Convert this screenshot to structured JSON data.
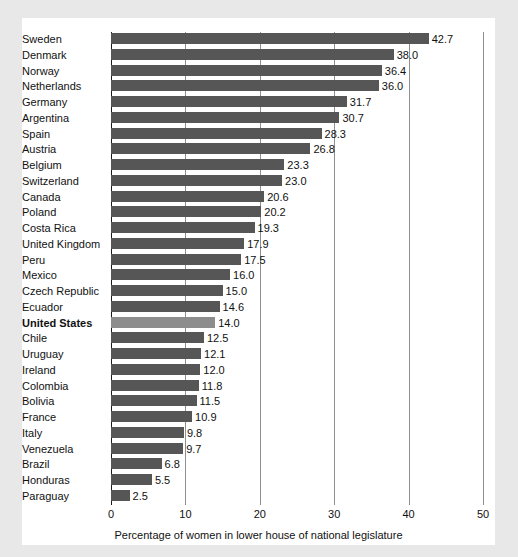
{
  "chart_data": {
    "type": "bar",
    "orientation": "horizontal",
    "title": "",
    "xlabel": "Percentage of women in lower house of national legislature",
    "ylabel": "",
    "xlim": [
      0,
      50
    ],
    "xticks": [
      0,
      10,
      20,
      30,
      40,
      50
    ],
    "grid": true,
    "legend": null,
    "categories": [
      "Sweden",
      "Denmark",
      "Norway",
      "Netherlands",
      "Germany",
      "Argentina",
      "Spain",
      "Austria",
      "Belgium",
      "Switzerland",
      "Canada",
      "Poland",
      "Costa Rica",
      "United Kingdom",
      "Peru",
      "Mexico",
      "Czech Republic",
      "Ecuador",
      "United States",
      "Chile",
      "Uruguay",
      "Ireland",
      "Colombia",
      "Bolivia",
      "France",
      "Italy",
      "Venezuela",
      "Brazil",
      "Honduras",
      "Paraguay"
    ],
    "values": [
      42.7,
      38.0,
      36.4,
      36.0,
      31.7,
      30.7,
      28.3,
      26.8,
      23.3,
      23.0,
      20.6,
      20.2,
      19.3,
      17.9,
      17.5,
      16.0,
      15.0,
      14.6,
      14.0,
      12.5,
      12.1,
      12.0,
      11.8,
      11.5,
      10.9,
      9.8,
      9.7,
      6.8,
      5.5,
      2.5
    ],
    "value_labels": [
      "42.7",
      "38.0",
      "36.4",
      "36.0",
      "31.7",
      "30.7",
      "28.3",
      "26.8",
      "23.3",
      "23.0",
      "20.6",
      "20.2",
      "19.3",
      "17.9",
      "17.5",
      "16.0",
      "15.0",
      "14.6",
      "14.0",
      "12.5",
      "12.1",
      "12.0",
      "11.8",
      "11.5",
      "10.9",
      "9.8",
      "9.7",
      "6.8",
      "5.5",
      "2.5"
    ],
    "tick_labels": [
      "0",
      "10",
      "20",
      "30",
      "40",
      "50"
    ],
    "highlight_category": "United States",
    "colors": {
      "bar": "#565656",
      "bar_highlight": "#8d8d8d",
      "background": "#ffffff",
      "page_background": "#e8e8e8",
      "text": "#111111",
      "gridline": "#8e8e8e",
      "axis": "#1a1a1a"
    }
  }
}
